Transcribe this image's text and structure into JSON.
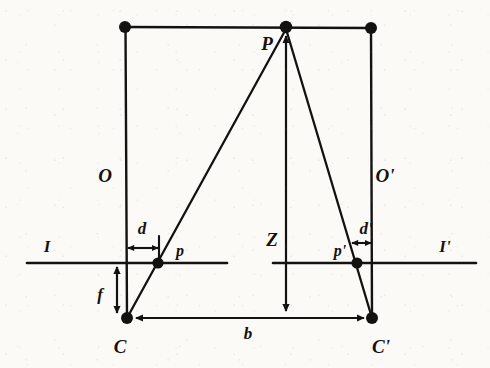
{
  "figure": {
    "type": "stereo-vision-geometry-diagram",
    "background_color": "#fbfaf7",
    "ink_color": "#141210",
    "labels": {
      "scene_point": "P",
      "left_optical_axis": "O",
      "right_optical_axis": "O'",
      "left_image_plane": "I",
      "right_image_plane": "I'",
      "left_image_point": "p",
      "right_image_point": "p'",
      "left_disparity": "d",
      "right_disparity": "d'",
      "focal_length": "f",
      "depth": "Z",
      "baseline": "b",
      "left_camera_center": "C",
      "right_camera_center": "C'"
    },
    "label_positions": {
      "scene_point": {
        "x": 267,
        "y": 43
      },
      "left_optical_axis": {
        "x": 105,
        "y": 175
      },
      "right_optical_axis": {
        "x": 385,
        "y": 175
      },
      "left_image_plane": {
        "x": 47,
        "y": 246
      },
      "right_image_plane": {
        "x": 445,
        "y": 246
      },
      "left_image_point": {
        "x": 180,
        "y": 251
      },
      "right_image_point": {
        "x": 340,
        "y": 251
      },
      "left_disparity": {
        "x": 142,
        "y": 228
      },
      "right_disparity": {
        "x": 366,
        "y": 228
      },
      "focal_length": {
        "x": 100,
        "y": 294
      },
      "depth": {
        "x": 272,
        "y": 239
      },
      "baseline": {
        "x": 248,
        "y": 333
      },
      "left_camera_center": {
        "x": 120,
        "y": 346
      },
      "right_camera_center": {
        "x": 381,
        "y": 346
      }
    },
    "geometry": {
      "scene_point_node": {
        "x": 286,
        "y": 27
      },
      "left_top_node": {
        "x": 125,
        "y": 27
      },
      "right_top_node": {
        "x": 371,
        "y": 28
      },
      "left_center_node": {
        "x": 127,
        "y": 318
      },
      "right_center_node": {
        "x": 372,
        "y": 318
      },
      "left_image_node": {
        "x": 158,
        "y": 263
      },
      "right_image_node": {
        "x": 357,
        "y": 263
      },
      "image_line_y": 263,
      "baseline_y": 318,
      "left_image_line": {
        "x1": 27,
        "x2": 227
      },
      "right_image_line": {
        "x1": 273,
        "x2": 476
      },
      "top_line": {
        "x1": 125,
        "x2": 371
      },
      "depth_arrow": {
        "x": 286,
        "y1": 313,
        "y2": 33
      },
      "baseline_arrow": {
        "y": 318,
        "x1": 133,
        "x2": 366
      },
      "focal_arrow": {
        "x": 117,
        "y1": 265,
        "y2": 315
      },
      "disparity_arrow_left": {
        "y": 248,
        "x1": 127,
        "x2": 159
      },
      "disparity_arrow_right": {
        "y": 243,
        "x1": 350,
        "x2": 372
      },
      "left_tick": {
        "x": 159,
        "y1": 236,
        "y2": 263
      }
    }
  }
}
